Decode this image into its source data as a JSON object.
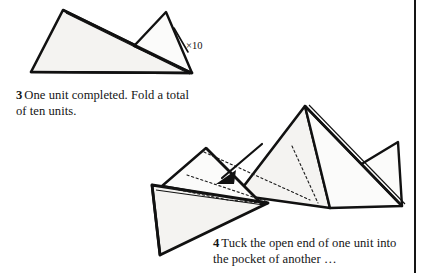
{
  "page": {
    "background_color": "#ffffff",
    "ink_color": "#111111",
    "paper_fill_color": "#f4f3f1",
    "width": 429,
    "height": 273
  },
  "column_rule": {
    "name": "column-divider-rule",
    "color": "#151515",
    "x": 414,
    "width": 2
  },
  "steps": [
    {
      "number": "3",
      "caption": "One unit completed. Fold a total of ten units.",
      "annotation": "×10",
      "annotation_meaning": "repeat ten times",
      "diagram_description": "Completed parallelogram-shaped origami unit formed of two overlapping triangular flaps"
    },
    {
      "number": "4",
      "caption": "Tuck the open end of one unit into the pocket of another …",
      "annotation": "",
      "annotation_meaning": "",
      "diagram_description": "Two completed units being joined; a solid arrow shows the point of one unit inserted into the pocket of the other, with dotted lines marking the hidden edges inside the pocket"
    }
  ]
}
